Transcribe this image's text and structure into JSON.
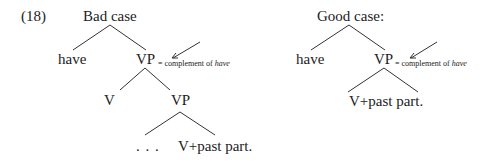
{
  "example_number": "(18)",
  "bad_tree": {
    "title": "Bad case",
    "nodes": {
      "have": "have",
      "vp": "VP",
      "v": "V",
      "vp2": "VP",
      "ellipsis": ". . .",
      "participle": "V+past part."
    },
    "annotation": {
      "prefix": "= complement of ",
      "emph": "have"
    }
  },
  "good_tree": {
    "title": "Good case:",
    "nodes": {
      "have": "have",
      "vp": "VP",
      "participle": "V+past part."
    },
    "annotation": {
      "prefix": "= complement of ",
      "emph": "have"
    }
  }
}
